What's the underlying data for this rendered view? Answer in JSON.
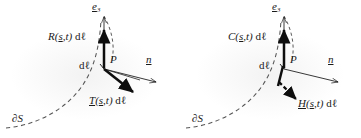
{
  "figure": {
    "type": "vector-diagram",
    "panel_count": 2,
    "stroke_color": "#151515",
    "dashed_color": "#4a4a4a",
    "background": "#ffffff"
  },
  "panels": [
    {
      "id": "left",
      "labels": {
        "axis_e3": "e",
        "axis_e3_sub": "3",
        "vertical_vector": "R",
        "vertical_vector_args": "(s,t)",
        "vertical_vector_measure": "dℓ",
        "normal_vector": "n",
        "oblique_vector": "T",
        "oblique_vector_args": "(s,t)",
        "oblique_vector_measure": "dℓ",
        "element_measure": "dℓ",
        "point": "P",
        "boundary": "∂S"
      }
    },
    {
      "id": "right",
      "labels": {
        "axis_e3": "e",
        "axis_e3_sub": "3",
        "vertical_vector": "C",
        "vertical_vector_args": "(s,t)",
        "vertical_vector_measure": "dℓ",
        "normal_vector": "n",
        "oblique_vector": "H",
        "oblique_vector_args": "(s,t)",
        "oblique_vector_measure": "dℓ",
        "element_measure": "dℓ",
        "point": "P",
        "boundary": "∂S"
      }
    }
  ]
}
